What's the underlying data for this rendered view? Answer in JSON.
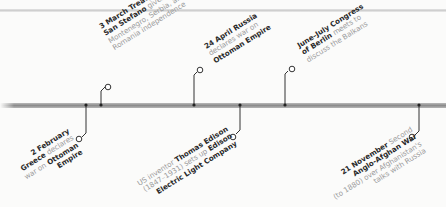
{
  "page": {
    "background": "#fbfbfa",
    "bar_color": "#8c8c8c",
    "text_bold_color": "#2a2a2a",
    "text_light_color": "#9a9a9a"
  },
  "events": [
    {
      "id": "greece",
      "position": "below",
      "lines": [
        [
          {
            "t": "2 February",
            "b": true
          }
        ],
        [
          {
            "t": "Greece",
            "b": true
          },
          {
            "t": " declares",
            "b": false
          }
        ],
        [
          {
            "t": "war on ",
            "b": false
          },
          {
            "t": "Ottoman",
            "b": true
          }
        ],
        [
          {
            "t": "Empire",
            "b": true
          }
        ]
      ]
    },
    {
      "id": "san-stefano",
      "position": "above",
      "lines": [
        [
          {
            "t": "3 March Treaty of",
            "b": true
          }
        ],
        [
          {
            "t": "San Stefano",
            "b": true
          },
          {
            "t": " gives",
            "b": false
          }
        ],
        [
          {
            "t": "Montenegro, Serbia, and",
            "b": false
          }
        ],
        [
          {
            "t": "Romania independence",
            "b": false
          }
        ]
      ]
    },
    {
      "id": "russia-war",
      "position": "above",
      "lines": [
        [
          {
            "t": "24 April Russia",
            "b": true
          }
        ],
        [
          {
            "t": "declares war on",
            "b": false
          }
        ],
        [
          {
            "t": "Ottoman Empire",
            "b": true
          }
        ]
      ]
    },
    {
      "id": "edison",
      "position": "below",
      "lines": [
        [
          {
            "t": "US inventor ",
            "b": false
          },
          {
            "t": "Thomas Edison",
            "b": true
          }
        ],
        [
          {
            "t": "(1847–1931) sets up ",
            "b": false
          },
          {
            "t": "Edison",
            "b": true
          }
        ],
        [
          {
            "t": "Electric Light Company",
            "b": true
          }
        ]
      ]
    },
    {
      "id": "congress-berlin",
      "position": "above",
      "lines": [
        [
          {
            "t": "June–July Congress",
            "b": true
          }
        ],
        [
          {
            "t": "of Berlin",
            "b": true
          },
          {
            "t": " meets to",
            "b": false
          }
        ],
        [
          {
            "t": "discuss the Balkans",
            "b": false
          }
        ]
      ]
    },
    {
      "id": "afghan-war",
      "position": "below",
      "lines": [
        [
          {
            "t": "21 November",
            "b": true
          },
          {
            "t": " Second",
            "b": false
          }
        ],
        [
          {
            "t": "Anglo-Afghan War",
            "b": true
          }
        ],
        [
          {
            "t": "(to 1880) over Afghanistan's",
            "b": false
          }
        ],
        [
          {
            "t": "talks with Russia",
            "b": false
          }
        ]
      ]
    }
  ]
}
